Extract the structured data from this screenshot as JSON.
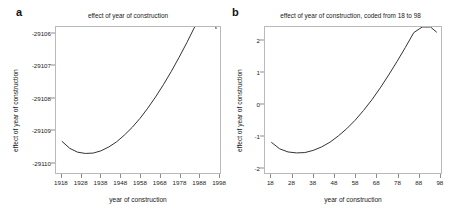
{
  "figure": {
    "panel_a_label": "a",
    "panel_b_label": "b",
    "line_color": "#333333",
    "axis_color": "#b9b9b9",
    "background": "#ffffff"
  },
  "chart_data": [
    {
      "type": "line",
      "panel": "a",
      "title": "effect of year of construction",
      "xlabel": "year of construction",
      "ylabel": "effect of year of construction",
      "xlim": [
        1915,
        1999
      ],
      "ylim": [
        -29110.35,
        -29105.8
      ],
      "xticks": [
        1918,
        1928,
        1938,
        1948,
        1958,
        1968,
        1978,
        1988,
        1998
      ],
      "xticklabels": [
        "1918",
        "1928",
        "1938",
        "1948",
        "1958",
        "1968",
        "1978",
        "1988",
        "1998"
      ],
      "yticks": [
        -29106,
        -29107,
        -29108,
        -29109,
        -29110
      ],
      "yticklabels": [
        "-29106",
        "-29107",
        "-29108",
        "-29109",
        "-29110"
      ],
      "grid": false,
      "legend": "none",
      "x": [
        1918,
        1922,
        1926,
        1930,
        1934,
        1938,
        1942,
        1946,
        1950,
        1954,
        1958,
        1962,
        1966,
        1970,
        1974,
        1978,
        1982,
        1986,
        1990,
        1994,
        1997
      ],
      "y": [
        -29109.36,
        -29109.58,
        -29109.7,
        -29109.74,
        -29109.73,
        -29109.66,
        -29109.54,
        -29109.38,
        -29109.17,
        -29108.93,
        -29108.65,
        -29108.33,
        -29107.98,
        -29107.6,
        -29107.19,
        -29106.75,
        -29106.29,
        -29105.8,
        -29105.28,
        -29104.74,
        -29105.86
      ]
    },
    {
      "type": "line",
      "panel": "b",
      "title": "effect of year of construction, coded from 18 to 98",
      "xlabel": "year of construction",
      "ylabel": "effect of year of construction",
      "xlim": [
        15,
        99
      ],
      "ylim": [
        -2.2,
        2.45
      ],
      "xticks": [
        18,
        28,
        38,
        48,
        58,
        68,
        78,
        88,
        98
      ],
      "xticklabels": [
        "18",
        "28",
        "38",
        "48",
        "58",
        "68",
        "78",
        "88",
        "98"
      ],
      "yticks": [
        2,
        1,
        0,
        -1,
        -2
      ],
      "yticklabels": [
        "2",
        "1",
        "0",
        "-1",
        "-2"
      ],
      "grid": false,
      "legend": "none",
      "x": [
        18,
        22,
        26,
        30,
        34,
        38,
        42,
        46,
        50,
        54,
        58,
        62,
        66,
        70,
        74,
        78,
        82,
        86,
        90,
        94,
        97
      ],
      "y": [
        -1.22,
        -1.43,
        -1.53,
        -1.56,
        -1.55,
        -1.48,
        -1.37,
        -1.22,
        -1.02,
        -0.79,
        -0.52,
        -0.21,
        0.13,
        0.51,
        0.92,
        1.35,
        1.8,
        2.27,
        2.45,
        2.45,
        2.28
      ]
    }
  ]
}
